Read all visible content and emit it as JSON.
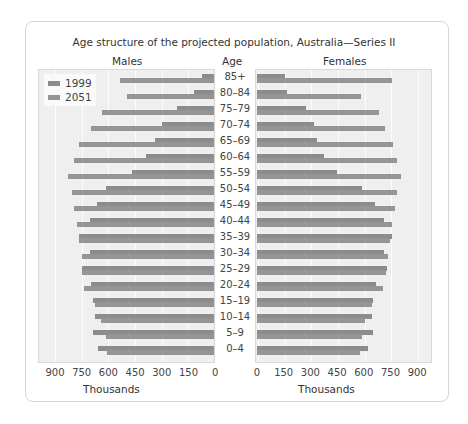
{
  "chart_data": {
    "type": "bar",
    "subtype": "population-pyramid",
    "title": "Age structure of the projected population, Australia—Series II",
    "axis_header": "Age",
    "panels": {
      "left": {
        "label": "Males",
        "xlabel": "Thousands",
        "ticks": [
          "900",
          "750",
          "600",
          "450",
          "300",
          "150",
          "0"
        ]
      },
      "right": {
        "label": "Females",
        "xlabel": "Thousands",
        "ticks": [
          "0",
          "150",
          "300",
          "450",
          "600",
          "750",
          "900"
        ]
      }
    },
    "xlim": [
      0,
      900
    ],
    "grid": true,
    "legend": {
      "position": "upper-left of Males panel",
      "entries": [
        "1999",
        "2051"
      ]
    },
    "categories": [
      "85+",
      "80–84",
      "75–79",
      "70–74",
      "65–69",
      "60–64",
      "55–59",
      "50–54",
      "45–49",
      "40–44",
      "35–39",
      "30–34",
      "25–29",
      "20–24",
      "15–19",
      "10–14",
      "5–9",
      "0–4"
    ],
    "series": [
      {
        "name": "Males 1999",
        "values": [
          70,
          110,
          210,
          290,
          330,
          380,
          460,
          610,
          660,
          700,
          760,
          700,
          740,
          690,
          680,
          670,
          680,
          650
        ]
      },
      {
        "name": "Males 2051",
        "values": [
          530,
          490,
          630,
          690,
          760,
          790,
          820,
          800,
          790,
          770,
          760,
          740,
          740,
          730,
          670,
          635,
          610,
          600
        ]
      },
      {
        "name": "Females 1999",
        "values": [
          157,
          170,
          275,
          320,
          340,
          375,
          450,
          590,
          665,
          715,
          760,
          715,
          730,
          670,
          650,
          645,
          655,
          625
        ]
      },
      {
        "name": "Females 2051",
        "values": [
          760,
          585,
          685,
          720,
          765,
          785,
          810,
          790,
          775,
          760,
          750,
          735,
          725,
          710,
          645,
          610,
          590,
          580
        ]
      }
    ]
  }
}
